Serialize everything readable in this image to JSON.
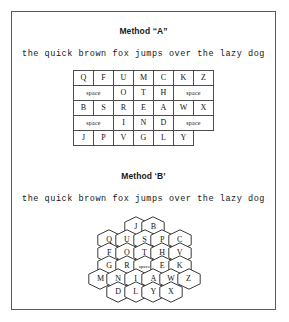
{
  "figure": {
    "border_color": "#5a5a5a",
    "background": "#ffffff"
  },
  "method_a": {
    "title": "Method “A”",
    "sample_text": "the quick brown fox jumps over the lazy dog",
    "layout_type": "rectangular-grid",
    "columns": 7,
    "rows": [
      {
        "cells": [
          {
            "label": "Q",
            "colspan": 1,
            "type": "letter"
          },
          {
            "label": "F",
            "colspan": 1,
            "type": "letter"
          },
          {
            "label": "U",
            "colspan": 1,
            "type": "letter"
          },
          {
            "label": "M",
            "colspan": 1,
            "type": "letter"
          },
          {
            "label": "C",
            "colspan": 1,
            "type": "letter"
          },
          {
            "label": "K",
            "colspan": 1,
            "type": "letter"
          },
          {
            "label": "Z",
            "colspan": 1,
            "type": "letter"
          }
        ]
      },
      {
        "cells": [
          {
            "label": "space",
            "colspan": 2,
            "type": "space"
          },
          {
            "label": "O",
            "colspan": 1,
            "type": "letter"
          },
          {
            "label": "T",
            "colspan": 1,
            "type": "letter"
          },
          {
            "label": "H",
            "colspan": 1,
            "type": "letter"
          },
          {
            "label": "space",
            "colspan": 2,
            "type": "space"
          }
        ]
      },
      {
        "cells": [
          {
            "label": "B",
            "colspan": 1,
            "type": "letter"
          },
          {
            "label": "S",
            "colspan": 1,
            "type": "letter"
          },
          {
            "label": "R",
            "colspan": 1,
            "type": "letter"
          },
          {
            "label": "E",
            "colspan": 1,
            "type": "letter"
          },
          {
            "label": "A",
            "colspan": 1,
            "type": "letter"
          },
          {
            "label": "W",
            "colspan": 1,
            "type": "letter"
          },
          {
            "label": "X",
            "colspan": 1,
            "type": "letter"
          }
        ]
      },
      {
        "cells": [
          {
            "label": "space",
            "colspan": 2,
            "type": "space"
          },
          {
            "label": "I",
            "colspan": 1,
            "type": "letter"
          },
          {
            "label": "N",
            "colspan": 1,
            "type": "letter"
          },
          {
            "label": "D",
            "colspan": 1,
            "type": "letter"
          },
          {
            "label": "space",
            "colspan": 2,
            "type": "space"
          }
        ]
      },
      {
        "cells": [
          {
            "label": "J",
            "colspan": 1,
            "type": "letter"
          },
          {
            "label": "P",
            "colspan": 1,
            "type": "letter"
          },
          {
            "label": "V",
            "colspan": 1,
            "type": "letter"
          },
          {
            "label": "G",
            "colspan": 1,
            "type": "letter"
          },
          {
            "label": "L",
            "colspan": 1,
            "type": "letter"
          },
          {
            "label": "Y",
            "colspan": 1,
            "type": "letter"
          },
          {
            "label": "",
            "colspan": 1,
            "type": "blank"
          }
        ]
      }
    ]
  },
  "method_b": {
    "title": "Method ‘B’",
    "sample_text": "the quick brown fox jumps over the lazy dog",
    "layout_type": "hexagonal-grid",
    "rows": [
      {
        "keys": [
          {
            "label": "J",
            "type": "letter"
          },
          {
            "label": "B",
            "type": "letter"
          }
        ]
      },
      {
        "keys": [
          {
            "label": "Q",
            "type": "letter"
          },
          {
            "label": "U",
            "type": "letter"
          },
          {
            "label": "S",
            "type": "letter"
          },
          {
            "label": "P",
            "type": "letter"
          },
          {
            "label": "C",
            "type": "letter"
          }
        ]
      },
      {
        "keys": [
          {
            "label": "F",
            "type": "letter"
          },
          {
            "label": "O",
            "type": "letter"
          },
          {
            "label": "T",
            "type": "letter"
          },
          {
            "label": "H",
            "type": "letter"
          },
          {
            "label": "V",
            "type": "letter"
          }
        ]
      },
      {
        "keys": [
          {
            "label": "G",
            "type": "letter"
          },
          {
            "label": "R",
            "type": "letter"
          },
          {
            "label": "space",
            "type": "space"
          },
          {
            "label": "E",
            "type": "letter"
          },
          {
            "label": "K",
            "type": "letter"
          }
        ]
      },
      {
        "keys": [
          {
            "label": "M",
            "type": "letter"
          },
          {
            "label": "N",
            "type": "letter"
          },
          {
            "label": "I",
            "type": "letter"
          },
          {
            "label": "A",
            "type": "letter"
          },
          {
            "label": "W",
            "type": "letter"
          },
          {
            "label": "Z",
            "type": "letter"
          }
        ]
      },
      {
        "keys": [
          {
            "label": "D",
            "type": "letter"
          },
          {
            "label": "L",
            "type": "letter"
          },
          {
            "label": "Y",
            "type": "letter"
          },
          {
            "label": "X",
            "type": "letter"
          }
        ]
      }
    ]
  }
}
